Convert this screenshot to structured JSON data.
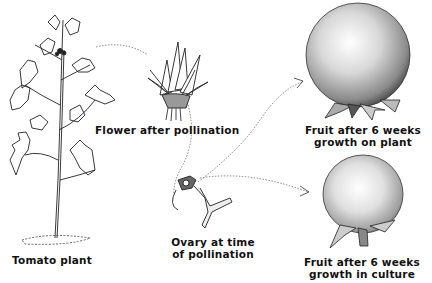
{
  "figure": {
    "background": "#ffffff",
    "ink": "#111111",
    "stages": [
      {
        "id": "tomato-plant",
        "label_lines": [
          "Tomato plant"
        ]
      },
      {
        "id": "flower",
        "label_lines": [
          "Flower after pollination"
        ]
      },
      {
        "id": "ovary",
        "label_lines": [
          "Ovary at time",
          "of pollination"
        ]
      },
      {
        "id": "fruit-plant",
        "label_lines": [
          "Fruit after 6 weeks",
          "growth on plant"
        ]
      },
      {
        "id": "fruit-culture",
        "label_lines": [
          "Fruit after 6 weeks",
          "growth in culture"
        ]
      }
    ],
    "arrows": [
      {
        "from": "tomato-plant",
        "to": "flower",
        "style": "dotted"
      },
      {
        "from": "flower",
        "to": "ovary",
        "style": "dotted"
      },
      {
        "from": "ovary",
        "to": "fruit-plant",
        "style": "dotted"
      },
      {
        "from": "ovary",
        "to": "fruit-culture",
        "style": "dotted"
      }
    ]
  }
}
